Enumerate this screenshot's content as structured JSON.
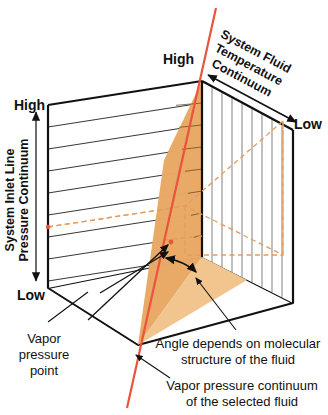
{
  "figure": {
    "background": "#ffffff"
  },
  "colors": {
    "outline": "#111111",
    "grid_left": "#3a3a3a",
    "grid_right": "#8c8c8c",
    "wedge_fill": "#E8A863",
    "wedge_fill_light": "#F2C48E",
    "vapor_line": "#E8543C",
    "dashed_guide": "#E79B5A",
    "text": "#111111"
  },
  "axes": {
    "vertical": {
      "label_line1": "System Inlet Line",
      "label_line2": "Pressure Continuum",
      "high_label": "High",
      "low_label": "Low"
    },
    "depth": {
      "label_line1": "System Fluid",
      "label_line2": "Temperature",
      "label_line3": "Continuum",
      "high_label": "High",
      "low_label": "Low"
    }
  },
  "annotations": {
    "vapor_point": {
      "line1": "Vapor",
      "line2": "pressure",
      "line3": "point"
    },
    "angle_note": {
      "line1": "Angle depends on molecular",
      "line2": "structure of the fluid"
    },
    "vapor_continuum_note": {
      "line1": "Vapor pressure continuum",
      "line2": "of the selected fluid"
    }
  },
  "geometry": {
    "left_face_grid_lines": 8,
    "right_face_grid_lines": 9,
    "wedge_description": "orange triangular region between the vapor pressure line and the front vertical edge"
  }
}
